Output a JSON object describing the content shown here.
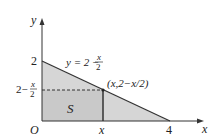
{
  "diagram": {
    "axes": {
      "x_label": "x",
      "y_label": "y",
      "origin_label": "O"
    },
    "ticks": {
      "y_intercept": "2",
      "x_intercept": "4",
      "x_point": "x"
    },
    "curve_label": {
      "prefix": "y = 2 −",
      "frac_num": "x",
      "frac_den": "2"
    },
    "point_label": "(x,2−x/2)",
    "height_label": {
      "prefix": "2−",
      "frac_num": "x",
      "frac_den": "2"
    },
    "region_label": "S",
    "colors": {
      "shade": "#d4d4d4",
      "line": "#333333"
    }
  }
}
